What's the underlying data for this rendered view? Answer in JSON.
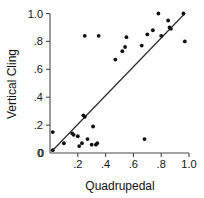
{
  "chart_data": {
    "type": "scatter",
    "title": "",
    "xlabel": "Quadrupedal",
    "ylabel": "Vertical Cling",
    "xlim": [
      0,
      1.0
    ],
    "ylim": [
      0,
      1.0
    ],
    "grid": false,
    "legend": null,
    "xticks": [
      "0",
      ".2",
      ".4",
      ".6",
      ".8",
      "1.0"
    ],
    "xtick_values": [
      0,
      0.2,
      0.4,
      0.6,
      0.8,
      1.0
    ],
    "yticks": [
      "0",
      ".2",
      ".4",
      ".6",
      ".8",
      "1.0"
    ],
    "ytick_values": [
      0,
      0.2,
      0.4,
      0.6,
      0.8,
      1.0
    ],
    "points": [
      {
        "x": 0.02,
        "y": 0.02
      },
      {
        "x": 0.02,
        "y": 0.15
      },
      {
        "x": 0.1,
        "y": 0.07
      },
      {
        "x": 0.16,
        "y": 0.14
      },
      {
        "x": 0.17,
        "y": 0.13
      },
      {
        "x": 0.2,
        "y": 0.12
      },
      {
        "x": 0.21,
        "y": 0.05
      },
      {
        "x": 0.23,
        "y": 0.07
      },
      {
        "x": 0.24,
        "y": 0.27
      },
      {
        "x": 0.25,
        "y": 0.26
      },
      {
        "x": 0.25,
        "y": 0.84
      },
      {
        "x": 0.27,
        "y": 0.1
      },
      {
        "x": 0.3,
        "y": 0.06
      },
      {
        "x": 0.31,
        "y": 0.19
      },
      {
        "x": 0.33,
        "y": 0.06
      },
      {
        "x": 0.34,
        "y": 0.07
      },
      {
        "x": 0.35,
        "y": 0.84
      },
      {
        "x": 0.47,
        "y": 0.67
      },
      {
        "x": 0.52,
        "y": 0.73
      },
      {
        "x": 0.54,
        "y": 0.76
      },
      {
        "x": 0.55,
        "y": 0.83
      },
      {
        "x": 0.66,
        "y": 0.77
      },
      {
        "x": 0.68,
        "y": 0.1
      },
      {
        "x": 0.7,
        "y": 0.85
      },
      {
        "x": 0.74,
        "y": 0.88
      },
      {
        "x": 0.78,
        "y": 1.0
      },
      {
        "x": 0.8,
        "y": 0.84
      },
      {
        "x": 0.85,
        "y": 0.95
      },
      {
        "x": 0.86,
        "y": 0.9
      },
      {
        "x": 0.87,
        "y": 0.89
      },
      {
        "x": 0.96,
        "y": 1.0
      },
      {
        "x": 0.97,
        "y": 0.8
      }
    ],
    "fit_line": {
      "x0": 0.02,
      "y0": 0.02,
      "x1": 0.97,
      "y1": 1.0
    }
  }
}
